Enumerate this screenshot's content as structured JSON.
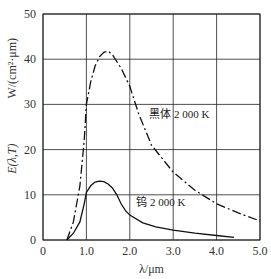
{
  "chart_data": {
    "type": "line",
    "title": "",
    "xlabel": "λ/μm",
    "ylabel_left": "E(λ,T)",
    "ylabel_right": "W/(cm²·μm)",
    "xlim": [
      0,
      5.0
    ],
    "ylim": [
      0,
      50
    ],
    "x_ticks": [
      "0",
      "1.0",
      "2.0",
      "3.0",
      "4.0",
      "5.0"
    ],
    "y_ticks": [
      "0",
      "10",
      "20",
      "30",
      "40",
      "50"
    ],
    "grid": true,
    "series": [
      {
        "name": "黑体 2 000 K",
        "style": "dash-dot",
        "x": [
          0.55,
          0.7,
          0.85,
          0.95,
          1.0,
          1.1,
          1.2,
          1.3,
          1.4,
          1.5,
          1.6,
          1.8,
          2.0,
          2.2,
          2.5,
          3.0,
          3.5,
          4.0,
          4.5,
          5.0
        ],
        "y": [
          0,
          4,
          12,
          22,
          30,
          35,
          38.5,
          40.5,
          41.5,
          41.8,
          41,
          38,
          34,
          28,
          21,
          15,
          11,
          8,
          6,
          4.2
        ]
      },
      {
        "name": "钨 2 000 K",
        "style": "solid",
        "x": [
          0.55,
          0.7,
          0.85,
          0.95,
          1.0,
          1.1,
          1.2,
          1.3,
          1.4,
          1.5,
          1.6,
          1.7,
          1.8,
          1.9,
          2.0,
          2.3,
          2.6,
          3.0,
          3.5,
          4.0,
          4.4
        ],
        "y": [
          0,
          1.5,
          4,
          8,
          10.5,
          12,
          12.8,
          13,
          12.9,
          12.4,
          11.5,
          10,
          8,
          6.5,
          5.5,
          3.8,
          2.9,
          2.2,
          1.5,
          1.0,
          0.6
        ]
      }
    ],
    "annotations": [
      {
        "text": "黑体 2 000 K",
        "x": 2.45,
        "y": 27
      },
      {
        "text": "钨 2 000 K",
        "x": 2.15,
        "y": 7.5
      }
    ]
  }
}
